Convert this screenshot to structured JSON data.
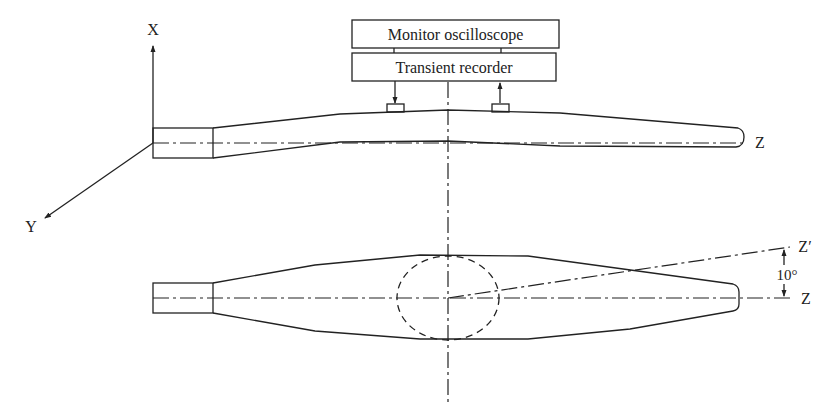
{
  "figure": {
    "instruments": {
      "monitor_label": "Monitor oscilloscope",
      "recorder_label": "Transient recorder"
    },
    "axes": {
      "x_label": "X",
      "y_label": "Y",
      "z_label_top": "Z",
      "z_label_bottom": "Z",
      "z_prime_label": "Z′",
      "angle_label": "10°"
    },
    "views": [
      {
        "name": "side-view",
        "description": "Blade side view with two strain sensors"
      },
      {
        "name": "top-view",
        "description": "Blade planform view with dashed circle and 10° rotated axis"
      }
    ],
    "colors": {
      "line": "#222222",
      "background": "#ffffff"
    }
  }
}
